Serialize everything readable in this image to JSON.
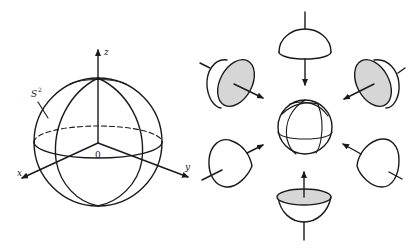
{
  "figure": {
    "left_panel": {
      "sphere_label": "S",
      "sphere_label_superscript": "2",
      "axes": {
        "z_label": "z",
        "x_label": "x",
        "y_label": "y",
        "origin_label": "0"
      }
    },
    "right_panel": {
      "center": "sphere-divided-into-octants",
      "pieces": [
        {
          "position": "top",
          "shape": "hemisphere-dome",
          "shaded": false,
          "arrow": "toward-center"
        },
        {
          "position": "upper-left",
          "shape": "hemisphere-tilted",
          "shaded": true,
          "arrow": "toward-center"
        },
        {
          "position": "upper-right",
          "shape": "hemisphere-tilted",
          "shaded": true,
          "arrow": "toward-center"
        },
        {
          "position": "lower-left",
          "shape": "curved-patch",
          "shaded": false,
          "arrow": "toward-center"
        },
        {
          "position": "lower-right",
          "shape": "curved-patch",
          "shaded": false,
          "arrow": "toward-center"
        },
        {
          "position": "bottom",
          "shape": "hemisphere-bowl",
          "shaded": true,
          "arrow": "toward-center"
        }
      ]
    },
    "colors": {
      "ink": "#1a1a1a",
      "shade": "#d6d6d6",
      "background": "#ffffff"
    }
  }
}
